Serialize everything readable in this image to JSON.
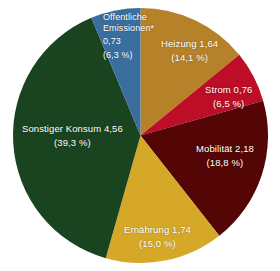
{
  "chart_data": {
    "type": "pie",
    "title": "",
    "subtitle": "",
    "xlabel": "",
    "ylabel": "",
    "legend_position": "none",
    "grid": false,
    "labels_inside_slices": true,
    "total": 11.61,
    "unit_note": "*",
    "categories": [
      "Heizung",
      "Strom",
      "Mobilität",
      "Ernährung",
      "Sonstiger Konsum",
      "Öffentliche Emissionen*"
    ],
    "values": [
      1.64,
      0.76,
      2.18,
      1.74,
      4.56,
      0.73
    ],
    "percentages": [
      14.1,
      6.5,
      18.8,
      15.0,
      39.3,
      6.3
    ],
    "colors": [
      "#b5822a",
      "#be0d26",
      "#540606",
      "#d5a827",
      "#1a4420",
      "#3a6e9e"
    ],
    "slices": [
      {
        "name": "Heizung",
        "label": "Heizung 1,64",
        "name_text": "Heizung",
        "value_text": "1,64",
        "percent_text": "(14,1 %)",
        "value": 1.64,
        "percent": 14.1,
        "color": "#b5822a"
      },
      {
        "name": "Strom",
        "label": "Strom 0,76",
        "name_text": "Strom",
        "value_text": "0,76",
        "percent_text": "(6,5 %)",
        "value": 0.76,
        "percent": 6.5,
        "color": "#be0d26"
      },
      {
        "name": "Mobilität",
        "label": "Mobilität 2,18",
        "name_text": "Mobilität",
        "value_text": "2,18",
        "percent_text": "(18,8 %)",
        "value": 2.18,
        "percent": 18.8,
        "color": "#540606"
      },
      {
        "name": "Ernährung",
        "label": "Ernährung 1,74",
        "name_text": "Ernährung",
        "value_text": "1,74",
        "percent_text": "(15,0 %)",
        "value": 1.74,
        "percent": 15.0,
        "color": "#d5a827"
      },
      {
        "name": "Sonstiger Konsum",
        "label": "Sonstiger Konsum 4,56",
        "name_text": "Sonstiger Konsum",
        "value_text": "4,56",
        "percent_text": "(39,3 %)",
        "value": 4.56,
        "percent": 39.3,
        "color": "#1a4420"
      },
      {
        "name": "Öffentliche Emissionen",
        "label": "Öffentliche Emissionen* 0,73",
        "name_line1": "Öffentliche",
        "name_line2": "Emissionen*",
        "value_text": "0,73",
        "percent_text": "(6,3 %)",
        "value": 0.73,
        "percent": 6.3,
        "color": "#3a6e9e"
      }
    ]
  },
  "figure": {
    "background_color": "#ffffff",
    "label_text_color": "#ffffff"
  }
}
